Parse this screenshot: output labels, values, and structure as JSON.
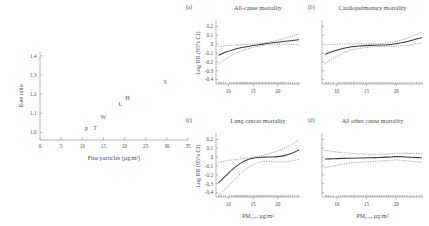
{
  "chart_data": [
    {
      "type": "scatter",
      "id": "fine-particles-rate-ratio",
      "title": "",
      "xlabel": "Fine particles (µg/m³)",
      "ylabel": "Rate ratio",
      "xlim": [
        0,
        35
      ],
      "ylim": [
        0.96,
        1.42
      ],
      "xticks": [
        "0",
        "5",
        "10",
        "15",
        "20",
        "25",
        "30",
        "35"
      ],
      "yticks": [
        "1.0",
        "1.1",
        "1.2",
        "1.3",
        "1.4"
      ],
      "grid": false,
      "legend": "none",
      "points": [
        {
          "label": "P",
          "x": 11.0,
          "y": 1.005
        },
        {
          "label": "T",
          "x": 13.0,
          "y": 1.012
        },
        {
          "label": "W",
          "x": 15.0,
          "y": 1.072
        },
        {
          "label": "L",
          "x": 19.0,
          "y": 1.14
        },
        {
          "label": "H",
          "x": 20.7,
          "y": 1.168
        },
        {
          "label": "S",
          "x": 29.6,
          "y": 1.252
        }
      ]
    },
    {
      "type": "line",
      "id": "all-cause-mortality",
      "panel_letter": "(a)",
      "title": "All-cause mortality",
      "xlabel": "",
      "ylabel": "Log RR (95% CI)",
      "xlim": [
        7.5,
        24.5
      ],
      "ylim": [
        -0.45,
        0.25
      ],
      "xticks": [
        "10",
        "15",
        "20"
      ],
      "yticks": [
        "0.2",
        "0.1",
        "0",
        "-0.1",
        "-0.2",
        "-0.3",
        "-0.4"
      ],
      "grid": false,
      "legend": "none",
      "x": [
        8.0,
        9.5,
        11.0,
        12.5,
        14.0,
        15.5,
        17.0,
        18.5,
        20.0,
        21.5,
        23.0,
        24.3
      ],
      "series": [
        {
          "name": "fit",
          "values": [
            -0.125,
            -0.09,
            -0.062,
            -0.042,
            -0.026,
            -0.012,
            0.0,
            0.012,
            0.022,
            0.032,
            0.042,
            0.05
          ]
        },
        {
          "name": "upper_95",
          "values": [
            -0.028,
            -0.018,
            -0.012,
            -0.008,
            -0.004,
            0.002,
            0.012,
            0.026,
            0.044,
            0.066,
            0.094,
            0.118
          ]
        },
        {
          "name": "lower_95",
          "values": [
            -0.225,
            -0.166,
            -0.116,
            -0.08,
            -0.052,
            -0.03,
            -0.014,
            -0.004,
            0.0,
            0.0,
            -0.004,
            -0.01
          ]
        }
      ]
    },
    {
      "type": "line",
      "id": "cardiopulmonary-mortality",
      "panel_letter": "(b)",
      "title": "Cardiopulmonary mortality",
      "xlabel": "",
      "ylabel": "",
      "xlim": [
        7.5,
        24.5
      ],
      "ylim": [
        -0.45,
        0.25
      ],
      "xticks": [
        "10",
        "15",
        "20"
      ],
      "yticks": [],
      "grid": false,
      "legend": "none",
      "x": [
        8.0,
        9.5,
        11.0,
        12.5,
        14.0,
        15.5,
        17.0,
        18.5,
        20.0,
        21.5,
        23.0,
        24.3
      ],
      "series": [
        {
          "name": "fit",
          "values": [
            -0.115,
            -0.078,
            -0.05,
            -0.03,
            -0.02,
            -0.014,
            -0.01,
            -0.006,
            0.004,
            0.024,
            0.05,
            0.072
          ]
        },
        {
          "name": "upper_95",
          "values": [
            -0.01,
            -0.002,
            0.002,
            0.004,
            0.004,
            0.004,
            0.006,
            0.014,
            0.03,
            0.06,
            0.098,
            0.13
          ]
        },
        {
          "name": "lower_95",
          "values": [
            -0.222,
            -0.156,
            -0.104,
            -0.066,
            -0.046,
            -0.034,
            -0.026,
            -0.024,
            -0.022,
            -0.014,
            0.0,
            0.012
          ]
        }
      ]
    },
    {
      "type": "line",
      "id": "lung-cancer-mortality",
      "panel_letter": "(c)",
      "title": "Lung cancer mortality",
      "xlabel": "PM₂.₅, µg/m³",
      "ylabel": "Log RR (95% CI)",
      "xlim": [
        7.5,
        24.5
      ],
      "ylim": [
        -0.45,
        0.25
      ],
      "xticks": [
        "10",
        "15",
        "20"
      ],
      "yticks": [
        "0.2",
        "0.1",
        "0",
        "-0.1",
        "-0.2",
        "-0.3",
        "-0.4"
      ],
      "grid": false,
      "legend": "none",
      "x": [
        8.0,
        9.5,
        11.0,
        12.5,
        14.0,
        15.5,
        17.0,
        18.5,
        20.0,
        21.5,
        23.0,
        24.3
      ],
      "series": [
        {
          "name": "fit",
          "values": [
            -0.29,
            -0.21,
            -0.13,
            -0.068,
            -0.026,
            -0.006,
            0.0,
            0.002,
            0.006,
            0.02,
            0.048,
            0.08
          ]
        },
        {
          "name": "upper_95",
          "values": [
            -0.06,
            -0.042,
            -0.03,
            -0.02,
            -0.01,
            0.004,
            0.022,
            0.044,
            0.07,
            0.104,
            0.15,
            0.196
          ]
        },
        {
          "name": "lower_95",
          "values": [
            -0.43,
            -0.356,
            -0.268,
            -0.186,
            -0.118,
            -0.072,
            -0.05,
            -0.048,
            -0.054,
            -0.052,
            -0.04,
            -0.026
          ]
        }
      ]
    },
    {
      "type": "line",
      "id": "all-other-cause-mortality",
      "panel_letter": "(d)",
      "title": "All other cause mortality",
      "xlabel": "PM₂.₅, µg/m³",
      "ylabel": "",
      "xlim": [
        7.5,
        24.5
      ],
      "ylim": [
        -0.45,
        0.25
      ],
      "xticks": [
        "10",
        "15",
        "20"
      ],
      "yticks": [],
      "grid": false,
      "legend": "none",
      "x": [
        8.0,
        9.5,
        11.0,
        12.5,
        14.0,
        15.5,
        17.0,
        18.5,
        20.0,
        21.5,
        23.0,
        24.3
      ],
      "series": [
        {
          "name": "fit",
          "values": [
            -0.022,
            -0.018,
            -0.014,
            -0.012,
            -0.01,
            -0.008,
            -0.004,
            0.0,
            0.006,
            0.002,
            -0.004,
            -0.008
          ]
        },
        {
          "name": "upper_95",
          "values": [
            0.076,
            0.062,
            0.05,
            0.042,
            0.036,
            0.032,
            0.032,
            0.036,
            0.044,
            0.044,
            0.042,
            0.04
          ]
        },
        {
          "name": "lower_95",
          "values": [
            -0.12,
            -0.098,
            -0.078,
            -0.064,
            -0.056,
            -0.05,
            -0.044,
            -0.038,
            -0.032,
            -0.04,
            -0.05,
            -0.058
          ]
        }
      ]
    }
  ]
}
